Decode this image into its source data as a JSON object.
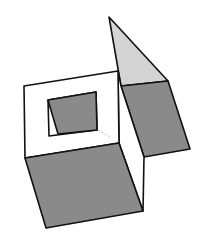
{
  "figure": {
    "colors": {
      "background": "#ffffff",
      "outline": "#111111",
      "dark_shade": "#8a8a8a",
      "light_shade": "#d4d4d4",
      "hidden_line": "#bbbbbb"
    }
  }
}
